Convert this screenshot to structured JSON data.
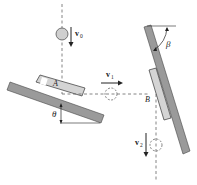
{
  "diagram": {
    "labels": {
      "v0": "v",
      "v0_sub": "0",
      "v1": "v",
      "v1_sub": "1",
      "v2": "v",
      "v2_sub": "2",
      "point_a": "A",
      "point_b": "B",
      "theta": "θ",
      "beta": "β"
    },
    "colors": {
      "plane_fill": "#9a9a9a",
      "plane_stroke": "#444444",
      "block_fill": "#d4d4d4",
      "ball_fill": "#cfcfcf",
      "dash": "#555555",
      "arrow": "#222222"
    }
  }
}
